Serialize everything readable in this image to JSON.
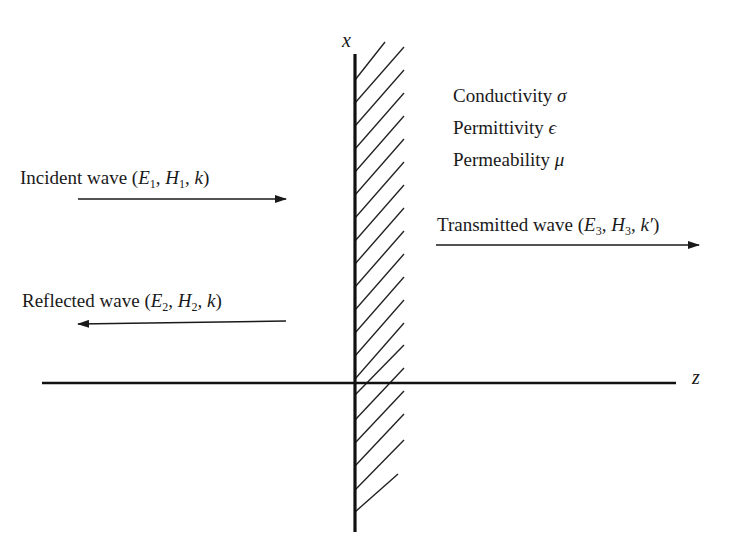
{
  "axes": {
    "x_label": "x",
    "z_label": "z"
  },
  "medium": {
    "properties": [
      {
        "name": "Conductivity",
        "symbol": "σ"
      },
      {
        "name": "Permittivity",
        "symbol": "ϵ"
      },
      {
        "name": "Permeability",
        "symbol": "μ"
      }
    ]
  },
  "waves": {
    "incident": {
      "text": "Incident wave (",
      "E": "E",
      "E_sub": "1",
      "H": "H",
      "H_sub": "1",
      "k": "k",
      "close": ")",
      "direction": "right"
    },
    "reflected": {
      "text": "Reflected wave (",
      "E": "E",
      "E_sub": "2",
      "H": "H",
      "H_sub": "2",
      "k": "k",
      "close": ")",
      "direction": "left"
    },
    "transmitted": {
      "text": "Transmitted wave (",
      "E": "E",
      "E_sub": "3",
      "H": "H",
      "H_sub": "3",
      "k": "k′",
      "close": ")",
      "direction": "right"
    }
  },
  "colors": {
    "ink": "#1a1a1a",
    "background": "#ffffff"
  }
}
